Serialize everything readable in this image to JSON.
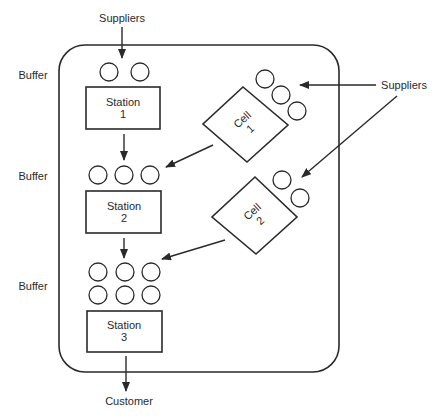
{
  "labels": {
    "suppliers_top": "Suppliers",
    "suppliers_right": "Suppliers",
    "customer": "Customer",
    "buffer_1": "Buffer",
    "buffer_2": "Buffer",
    "buffer_3": "Buffer"
  },
  "stations": [
    {
      "line1": "Station",
      "line2": "1"
    },
    {
      "line1": "Station",
      "line2": "2"
    },
    {
      "line1": "Station",
      "line2": "3"
    }
  ],
  "cells": [
    {
      "line1": "Cell",
      "line2": "1"
    },
    {
      "line1": "Cell",
      "line2": "2"
    }
  ],
  "buffers": [
    {
      "name": "buffer-1",
      "count": 2
    },
    {
      "name": "buffer-2",
      "count": 3
    },
    {
      "name": "buffer-3",
      "count": 6
    }
  ],
  "cell_buffers": [
    {
      "name": "cell-1-buffer",
      "count": 3
    },
    {
      "name": "cell-2-buffer",
      "count": 2
    }
  ],
  "colors": {
    "line": "#2a2a2a",
    "background": "#ffffff"
  }
}
